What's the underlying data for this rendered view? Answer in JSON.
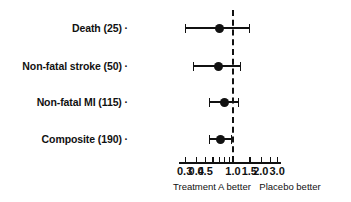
{
  "chart_data": {
    "type": "forest",
    "title": "",
    "xlabel": "",
    "ylabel": "",
    "scale": "log",
    "xlim": [
      0.26,
      3.3
    ],
    "grid": false,
    "reference_line": 1.0,
    "tick_values": [
      0.3,
      0.4,
      0.5,
      0.6,
      0.7,
      0.8,
      0.9,
      1.0,
      1.5,
      2.0,
      2.5,
      3.0
    ],
    "tick_labels": [
      "0.3",
      "0.4",
      "0.5",
      "",
      "",
      "",
      "",
      "1.0",
      "1.5",
      "2.0",
      "",
      "3.0"
    ],
    "categories": [
      "Death (25)",
      "Non-fatal stroke (50)",
      "Non-fatal MI (115)",
      "Composite (190)"
    ],
    "rows": [
      {
        "label": "Death (25)",
        "estimate": 0.72,
        "low": 0.3,
        "high": 1.49
      },
      {
        "label": "Non-fatal stroke (50)",
        "estimate": 0.7,
        "low": 0.37,
        "high": 1.18
      },
      {
        "label": "Non-fatal MI (115)",
        "estimate": 0.8,
        "low": 0.55,
        "high": 1.12
      },
      {
        "label": "Composite (190)",
        "estimate": 0.73,
        "low": 0.55,
        "high": 0.95
      }
    ],
    "annotations": {
      "left_caption": "Treatment A better",
      "right_caption": "Placebo better"
    },
    "colors": {
      "foreground": "#111111",
      "background": "#ffffff"
    }
  },
  "axis": {
    "left_caption": "Treatment A better",
    "right_caption": "Placebo better"
  },
  "labels": {
    "tick_suffix": "·"
  }
}
